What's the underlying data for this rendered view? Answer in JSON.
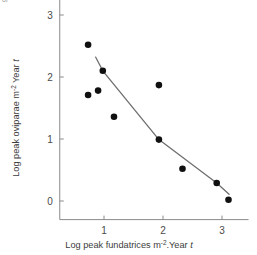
{
  "figure": {
    "top_note": "or",
    "background": "#ffffff",
    "axis_color": "#8a8a8a",
    "point_color": "#101010",
    "line_color": "#6e6e6e"
  },
  "chart_data": {
    "type": "scatter",
    "title": "",
    "xlabel": "Log peak fundatrices m-2.Year t",
    "ylabel": "Log peak oviparae m-2 Year t",
    "xlabel_parts": {
      "main": "Log peak fundatrices m",
      "sup": "-2",
      "mid": ".Year ",
      "italic": "t"
    },
    "ylabel_parts": {
      "main": "Log peak oviparae m",
      "sup": "-2",
      "mid": " Year ",
      "italic": "t"
    },
    "xticks": [
      1,
      2,
      3
    ],
    "xtick_labels": [
      "1",
      "2",
      "3"
    ],
    "yticks": [
      0,
      1,
      2,
      3
    ],
    "ytick_labels": [
      "0",
      "1",
      "2",
      "3"
    ],
    "xlim": [
      0.25,
      3.45
    ],
    "ylim": [
      -0.3,
      3.25
    ],
    "grid": false,
    "legend": "none",
    "points": [
      {
        "x": 0.73,
        "y": 2.52
      },
      {
        "x": 0.98,
        "y": 2.1
      },
      {
        "x": 0.73,
        "y": 1.71
      },
      {
        "x": 0.9,
        "y": 1.78
      },
      {
        "x": 1.17,
        "y": 1.36
      },
      {
        "x": 1.93,
        "y": 1.87
      },
      {
        "x": 1.93,
        "y": 0.99
      },
      {
        "x": 2.33,
        "y": 0.52
      },
      {
        "x": 2.91,
        "y": 0.29
      },
      {
        "x": 3.11,
        "y": 0.02
      }
    ],
    "fitted_line": [
      {
        "x": 0.86,
        "y": 2.32
      },
      {
        "x": 0.98,
        "y": 2.1
      },
      {
        "x": 1.93,
        "y": 0.99
      },
      {
        "x": 2.91,
        "y": 0.29
      },
      {
        "x": 3.12,
        "y": 0.11
      }
    ]
  }
}
